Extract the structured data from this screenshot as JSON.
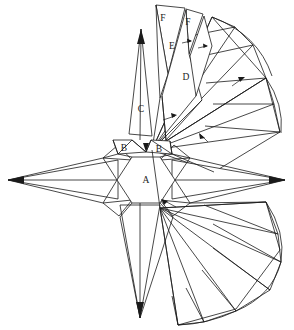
{
  "figure": {
    "background_color": "#ffffff",
    "line_color": "#1a1a1a",
    "width": 294,
    "height": 330,
    "labels": [
      {
        "id": "label-a",
        "text": "A",
        "x": 146,
        "y": 181,
        "desc": "central-hexagon"
      },
      {
        "id": "label-b-left",
        "text": "B",
        "x": 124,
        "y": 149,
        "desc": "left-small-triangle"
      },
      {
        "id": "label-b-right",
        "text": "B",
        "x": 159,
        "y": 150,
        "desc": "right-small-triangle"
      },
      {
        "id": "label-c",
        "text": "C",
        "x": 141,
        "y": 110,
        "desc": "upper-spike"
      },
      {
        "id": "label-d",
        "text": "D",
        "x": 186,
        "y": 78,
        "desc": "upper-right-wedge"
      },
      {
        "id": "label-e",
        "text": "E",
        "x": 172,
        "y": 47,
        "desc": "mid-upper-wedge"
      },
      {
        "id": "label-f-left",
        "text": "F",
        "x": 163,
        "y": 19,
        "desc": "top-left-wedge"
      },
      {
        "id": "label-f-right",
        "text": "F",
        "x": 188,
        "y": 23,
        "desc": "top-right-wedge"
      }
    ],
    "annotations": {
      "arrow_count": 6,
      "arrow_desc": "small fold-direction arrows"
    },
    "structure": {
      "center": {
        "x": 146,
        "y": 180
      },
      "hexagon_radius": 27,
      "spike_count": 6,
      "fan_sectors": 2,
      "fan_triangles_per_sector": 9
    }
  }
}
